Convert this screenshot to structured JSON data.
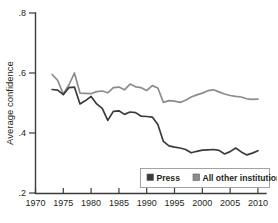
{
  "chart_data": {
    "type": "line",
    "title": "",
    "xlabel": "",
    "ylabel": "Average confidence",
    "xlim": [
      1970,
      2011
    ],
    "ylim": [
      0.2,
      0.8
    ],
    "grid": false,
    "legend_position": "bottom-right",
    "xticks": [
      1970,
      1975,
      1980,
      1985,
      1990,
      1995,
      2000,
      2005,
      2010
    ],
    "xtick_labels": [
      "1970",
      "1975",
      "1980",
      "1985",
      "1990",
      "1995",
      "2000",
      "2005",
      "2010"
    ],
    "yticks": [
      0.2,
      0.4,
      0.6,
      0.8
    ],
    "ytick_labels": [
      ".2",
      ".4",
      ".6",
      ".8"
    ],
    "x": [
      1973,
      1974,
      1975,
      1976,
      1977,
      1978,
      1979,
      1980,
      1981,
      1982,
      1983,
      1984,
      1985,
      1986,
      1987,
      1988,
      1989,
      1990,
      1991,
      1992,
      1993,
      1994,
      1995,
      1996,
      1997,
      1998,
      1999,
      2000,
      2001,
      2002,
      2003,
      2004,
      2005,
      2006,
      2007,
      2008,
      2009,
      2010
    ],
    "series": [
      {
        "name": "Press",
        "color": "#3b3b3b",
        "values": [
          0.545,
          0.543,
          0.528,
          0.551,
          0.553,
          0.497,
          0.508,
          0.522,
          0.497,
          0.482,
          0.442,
          0.472,
          0.474,
          0.462,
          0.47,
          0.468,
          0.456,
          0.455,
          0.453,
          0.428,
          0.372,
          0.357,
          0.353,
          0.35,
          0.345,
          0.334,
          0.339,
          0.343,
          0.344,
          0.345,
          0.342,
          0.33,
          0.338,
          0.35,
          0.337,
          0.327,
          0.333,
          0.341
        ]
      },
      {
        "name": "All other institutions",
        "color": "#8c8c8c",
        "values": [
          0.595,
          0.575,
          0.53,
          0.56,
          0.6,
          0.533,
          0.532,
          0.531,
          0.538,
          0.54,
          0.534,
          0.551,
          0.553,
          0.544,
          0.563,
          0.554,
          0.551,
          0.542,
          0.558,
          0.55,
          0.502,
          0.508,
          0.506,
          0.502,
          0.509,
          0.52,
          0.527,
          0.533,
          0.541,
          0.544,
          0.537,
          0.53,
          0.525,
          0.522,
          0.52,
          0.514,
          0.512,
          0.513
        ]
      }
    ],
    "legend": [
      {
        "label": "Press",
        "color": "#3b3b3b"
      },
      {
        "label": "All other institutions",
        "color": "#8c8c8c"
      }
    ]
  }
}
